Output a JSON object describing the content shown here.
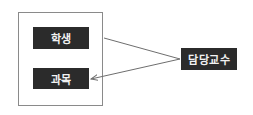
{
  "diagram": {
    "container": {
      "label": ""
    },
    "nodes": [
      {
        "id": "student",
        "label": "학생"
      },
      {
        "id": "course",
        "label": "과목"
      },
      {
        "id": "professor",
        "label": "담당교수"
      }
    ],
    "edges": [
      {
        "from": "student",
        "to": "professor",
        "arrow": "none"
      },
      {
        "from": "professor",
        "to": "course",
        "arrow": "end"
      }
    ],
    "colors": {
      "node_fill": "#2b2b2b",
      "node_text": "#f2f2f2",
      "edge": "#6e6e6e",
      "container_border": "#8a8a8a"
    }
  }
}
